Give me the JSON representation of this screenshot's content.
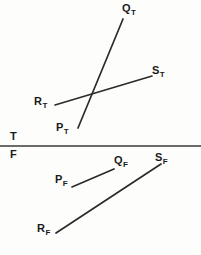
{
  "figure": {
    "name": "truth-value-split-diagram",
    "width": 201,
    "height": 255,
    "background_color": "#fdfdfb",
    "ink_color": "#1a1a1a",
    "line_color": "#2b2b2b"
  },
  "divider": {
    "name": "truth-falsity-divider",
    "true_label": "T",
    "false_label": "F",
    "line_y": 146,
    "line_x_start": 0,
    "line_x_end": 201,
    "line_width": 1.6,
    "color": "#3a3a3a"
  },
  "true_region": {
    "labels": [
      {
        "id": "q-true",
        "base": "Q",
        "sub": "T",
        "x": 122,
        "y": 3
      },
      {
        "id": "s-true",
        "base": "S",
        "sub": "T",
        "x": 152,
        "y": 65
      },
      {
        "id": "r-true",
        "base": "R",
        "sub": "T",
        "x": 34,
        "y": 96
      },
      {
        "id": "p-true",
        "base": "P",
        "sub": "T",
        "x": 56,
        "y": 122
      }
    ],
    "segments": [
      {
        "id": "pt-qt-segment",
        "from": "P_T",
        "to": "Q_T",
        "x1": 78,
        "y1": 128,
        "x2": 123,
        "y2": 19
      },
      {
        "id": "rt-st-segment",
        "from": "R_T",
        "to": "S_T",
        "x1": 55,
        "y1": 105,
        "x2": 152,
        "y2": 76
      }
    ]
  },
  "false_region": {
    "labels": [
      {
        "id": "q-false",
        "base": "Q",
        "sub": "F",
        "x": 114,
        "y": 155
      },
      {
        "id": "s-false",
        "base": "S",
        "sub": "F",
        "x": 155,
        "y": 152
      },
      {
        "id": "p-false",
        "base": "P",
        "sub": "F",
        "x": 55,
        "y": 174
      },
      {
        "id": "r-false",
        "base": "R",
        "sub": "F",
        "x": 37,
        "y": 223
      }
    ],
    "segments": [
      {
        "id": "pf-qf-segment",
        "from": "P_F",
        "to": "Q_F",
        "x1": 72,
        "y1": 187,
        "x2": 114,
        "y2": 169
      },
      {
        "id": "rf-sf-segment",
        "from": "R_F",
        "to": "S_F",
        "x1": 56,
        "y1": 233,
        "x2": 161,
        "y2": 164
      }
    ]
  }
}
